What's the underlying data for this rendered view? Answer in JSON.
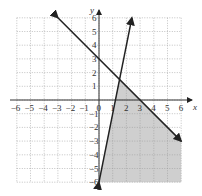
{
  "chart_data": {
    "type": "line",
    "title": "",
    "xlabel": "x",
    "ylabel": "y",
    "xlim": [
      -6,
      6
    ],
    "ylim": [
      -6,
      6
    ],
    "grid": true,
    "x_ticks": [
      "-6",
      "-5",
      "-4",
      "-3",
      "-2",
      "-1",
      "0",
      "1",
      "2",
      "3",
      "4",
      "5",
      "6"
    ],
    "y_ticks": [
      "-6",
      "-5",
      "-4",
      "-3",
      "-2",
      "-1",
      "1",
      "2",
      "3",
      "4",
      "5",
      "6"
    ],
    "series": [
      {
        "name": "y = 3 - x",
        "points": [
          [
            -3,
            6
          ],
          [
            6,
            -3
          ]
        ]
      },
      {
        "name": "y = 5x - 6",
        "points": [
          [
            0,
            -6
          ],
          [
            2.4,
            6
          ]
        ]
      }
    ],
    "shaded_region": [
      [
        1.5,
        1.5
      ],
      [
        6,
        -3
      ],
      [
        6,
        -6
      ],
      [
        0,
        -6
      ]
    ],
    "shade_color": "#cfcfcf"
  }
}
